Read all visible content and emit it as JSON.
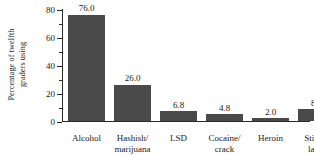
{
  "chart_data": {
    "type": "bar",
    "title": "",
    "xlabel": "",
    "ylabel": "Percentage of twelfth graders using",
    "ylabel_lines": [
      "Percentage of twelfth",
      "graders using"
    ],
    "categories": [
      "Alcohol",
      "Hashish/ marijuana",
      "LSD",
      "Cocaine/ crack",
      "Heroin",
      "Stimu- lants"
    ],
    "category_lines": [
      [
        "Alcohol"
      ],
      [
        "Hashish/",
        "marijuana"
      ],
      [
        "LSD"
      ],
      [
        "Cocaine/",
        "crack"
      ],
      [
        "Heroin"
      ],
      [
        "Stimu-",
        "lants"
      ]
    ],
    "values": [
      76.0,
      26.0,
      6.8,
      4.8,
      2.0,
      8.4
    ],
    "value_labels": [
      "76.0",
      "26.0",
      "6.8",
      "4.8",
      "2.0",
      "8.4"
    ],
    "ylim": [
      0,
      80
    ],
    "ytick_labels": [
      "80",
      "60",
      "40",
      "20",
      "0"
    ],
    "ytick_values": [
      80,
      60,
      40,
      20,
      0
    ],
    "yminor_values": [
      70,
      50,
      30,
      10
    ],
    "grid": false,
    "legend": null,
    "bar_color": "#4a4a4a",
    "axis_color": "#2a2a2a"
  }
}
